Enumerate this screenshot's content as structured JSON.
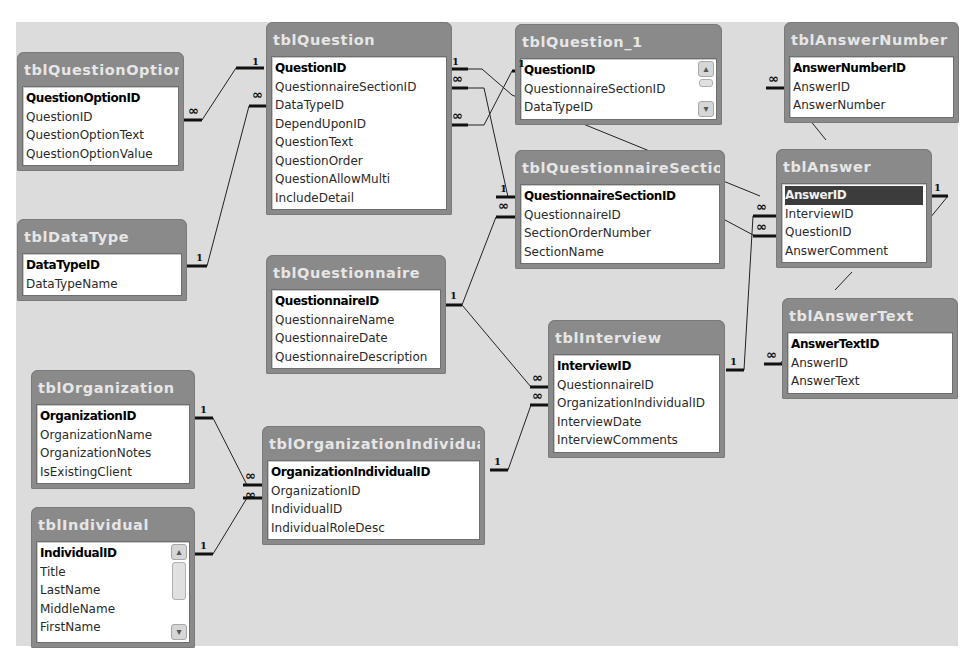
{
  "diagram": {
    "type": "Database relationships diagram",
    "background": "#dcdcdc",
    "header_color": "#8a8a8a",
    "tables": [
      {
        "id": "tblQuestionOption",
        "title": "tblQuestionOption",
        "fields": [
          "QuestionOptionID",
          "QuestionID",
          "QuestionOptionText",
          "QuestionOptionValue"
        ],
        "primary_key": "QuestionOptionID"
      },
      {
        "id": "tblQuestion",
        "title": "tblQuestion",
        "fields": [
          "QuestionID",
          "QuestionnaireSectionID",
          "DataTypeID",
          "DependUponID",
          "QuestionText",
          "QuestionOrder",
          "QuestionAllowMulti",
          "IncludeDetail"
        ],
        "primary_key": "QuestionID"
      },
      {
        "id": "tblQuestion_1",
        "title": "tblQuestion_1",
        "fields": [
          "QuestionID",
          "QuestionnaireSectionID",
          "DataTypeID"
        ],
        "primary_key": "QuestionID",
        "has_scrollbar": true
      },
      {
        "id": "tblAnswerNumber",
        "title": "tblAnswerNumber",
        "fields": [
          "AnswerNumberID",
          "AnswerID",
          "AnswerNumber"
        ],
        "primary_key": "AnswerNumberID"
      },
      {
        "id": "tblDataType",
        "title": "tblDataType",
        "fields": [
          "DataTypeID",
          "DataTypeName"
        ],
        "primary_key": "DataTypeID"
      },
      {
        "id": "tblQuestionnaireSection",
        "title": "tblQuestionnaireSection",
        "fields": [
          "QuestionnaireSectionID",
          "QuestionnaireID",
          "SectionOrderNumber",
          "SectionName"
        ],
        "primary_key": "QuestionnaireSectionID"
      },
      {
        "id": "tblAnswer",
        "title": "tblAnswer",
        "fields": [
          "AnswerID",
          "InterviewID",
          "QuestionID",
          "AnswerComment"
        ],
        "primary_key": "AnswerID",
        "selected_field": "AnswerID"
      },
      {
        "id": "tblQuestionnaire",
        "title": "tblQuestionnaire",
        "fields": [
          "QuestionnaireID",
          "QuestionnaireName",
          "QuestionnaireDate",
          "QuestionnaireDescription"
        ],
        "primary_key": "QuestionnaireID"
      },
      {
        "id": "tblAnswerText",
        "title": "tblAnswerText",
        "fields": [
          "AnswerTextID",
          "AnswerID",
          "AnswerText"
        ],
        "primary_key": "AnswerTextID"
      },
      {
        "id": "tblInterview",
        "title": "tblInterview",
        "fields": [
          "InterviewID",
          "QuestionnaireID",
          "OrganizationIndividualID",
          "InterviewDate",
          "InterviewComments"
        ],
        "primary_key": "InterviewID"
      },
      {
        "id": "tblOrganization",
        "title": "tblOrganization",
        "fields": [
          "OrganizationID",
          "OrganizationName",
          "OrganizationNotes",
          "IsExistingClient"
        ],
        "primary_key": "OrganizationID"
      },
      {
        "id": "tblOrganizationIndividual",
        "title": "tblOrganizationIndividual",
        "fields": [
          "OrganizationIndividualID",
          "OrganizationID",
          "IndividualID",
          "IndividualRoleDesc"
        ],
        "primary_key": "OrganizationIndividualID"
      },
      {
        "id": "tblIndividual",
        "title": "tblIndividual",
        "fields": [
          "IndividualID",
          "Title",
          "LastName",
          "MiddleName",
          "FirstName"
        ],
        "primary_key": "IndividualID",
        "has_scrollbar": true
      }
    ],
    "relationships": [
      {
        "one": "tblQuestion.QuestionID",
        "many": "tblQuestionOption.QuestionID",
        "one_label": "1",
        "many_label": "∞"
      },
      {
        "one": "tblDataType.DataTypeID",
        "many": "tblQuestion.DataTypeID",
        "one_label": "1",
        "many_label": "∞"
      },
      {
        "one": "tblQuestion.QuestionID",
        "many": "tblAnswer.QuestionID",
        "one_label": "1",
        "many_label": "∞"
      },
      {
        "one": "tblQuestion_1.QuestionID",
        "many": "tblQuestion.DependUponID",
        "one_label": "1",
        "many_label": "∞"
      },
      {
        "one": "tblQuestionnaireSection.QuestionnaireSectionID",
        "many": "tblQuestion.QuestionnaireSectionID",
        "one_label": "1",
        "many_label": "∞"
      },
      {
        "one": "tblQuestionnaire.QuestionnaireID",
        "many": "tblQuestionnaireSection.QuestionnaireID",
        "one_label": "1",
        "many_label": "∞"
      },
      {
        "one": "tblQuestionnaire.QuestionnaireID",
        "many": "tblInterview.QuestionnaireID",
        "one_label": "1",
        "many_label": "∞"
      },
      {
        "one": "tblInterview.InterviewID",
        "many": "tblAnswer.InterviewID",
        "one_label": "1",
        "many_label": "∞"
      },
      {
        "one": "tblAnswer.AnswerID",
        "many": "tblAnswerNumber.AnswerID",
        "one_label": "1",
        "many_label": "∞"
      },
      {
        "one": "tblAnswer.AnswerID",
        "many": "tblAnswerText.AnswerID",
        "one_label": "1",
        "many_label": "∞"
      },
      {
        "one": "tblOrganization.OrganizationID",
        "many": "tblOrganizationIndividual.OrganizationID",
        "one_label": "1",
        "many_label": "∞"
      },
      {
        "one": "tblIndividual.IndividualID",
        "many": "tblOrganizationIndividual.IndividualID",
        "one_label": "1",
        "many_label": "∞"
      },
      {
        "one": "tblOrganizationIndividual.OrganizationIndividualID",
        "many": "tblInterview.OrganizationIndividualID",
        "one_label": "1",
        "many_label": "∞"
      }
    ],
    "labels": {
      "one": "1",
      "many": "∞"
    },
    "scroll": {
      "up": "^",
      "down": "v"
    }
  }
}
